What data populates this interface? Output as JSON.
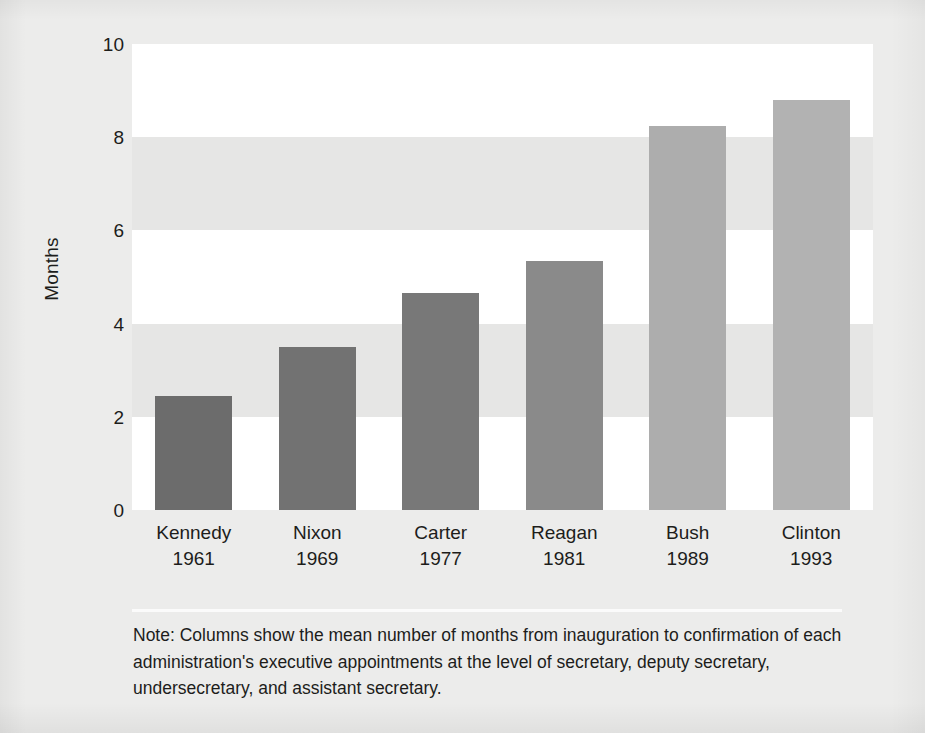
{
  "chart_data": {
    "type": "bar",
    "title": "",
    "subtitle": "",
    "xlabel": "",
    "ylabel": "Months",
    "ylim": [
      0,
      10
    ],
    "yticks": [
      "0",
      "2",
      "4",
      "6",
      "8",
      "10"
    ],
    "grid": "horizontal alternating shaded bands",
    "legend": "none",
    "categories": [
      "Kennedy",
      "Nixon",
      "Carter",
      "Reagan",
      "Bush",
      "Clinton"
    ],
    "years": [
      "1961",
      "1969",
      "1977",
      "1981",
      "1989",
      "1993"
    ],
    "values": [
      2.45,
      3.5,
      4.65,
      5.35,
      8.25,
      8.8
    ],
    "bar_colors": [
      "#6c6c6c",
      "#727272",
      "#787878",
      "#8a8a8a",
      "#adadad",
      "#b2b2b2"
    ],
    "bars": [
      {
        "label": "Kennedy",
        "year": "1961",
        "value": 2.45,
        "color": "#6c6c6c"
      },
      {
        "label": "Nixon",
        "year": "1969",
        "value": 3.5,
        "color": "#727272"
      },
      {
        "label": "Carter",
        "year": "1977",
        "value": 4.65,
        "color": "#787878"
      },
      {
        "label": "Reagan",
        "year": "1981",
        "value": 5.35,
        "color": "#8a8a8a"
      },
      {
        "label": "Bush",
        "year": "1989",
        "value": 8.25,
        "color": "#adadad"
      },
      {
        "label": "Clinton",
        "year": "1993",
        "value": 8.8,
        "color": "#b2b2b2"
      }
    ],
    "annotations": [
      "Note: Columns show the mean number of months from inauguration to confirmation of each administration's executive appointments at the level of secretary, deputy secretary, undersecretary, and assistant secretary."
    ]
  },
  "note": {
    "text": "Note: Columns show the mean number of months from inauguration to confirmation of each administration's executive appointments at the level of secretary, deputy secretary, undersecretary, and assistant secretary."
  },
  "colors": {
    "page_background": "#ececeb",
    "band_light": "#ffffff",
    "band_shaded": "#e6e6e5",
    "text": "#1d1d1b"
  }
}
